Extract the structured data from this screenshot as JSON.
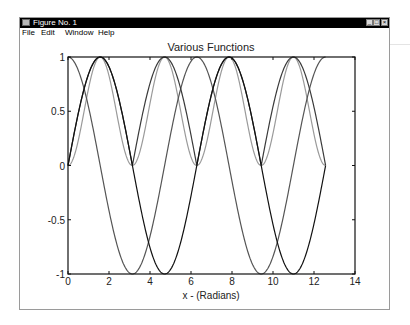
{
  "window": {
    "title": "Figure No. 1",
    "buttons": [
      "minimize",
      "maximize",
      "close"
    ],
    "button_glyphs": {
      "minimize": "_",
      "maximize": "□",
      "close": "×"
    }
  },
  "menubar": {
    "items": [
      {
        "label": "File"
      },
      {
        "label": "Edit"
      },
      {
        "label": "Window"
      },
      {
        "label": "Help"
      }
    ]
  },
  "chart_data": {
    "type": "line",
    "title": "Various Functions",
    "xlabel": "x - (Radians)",
    "ylabel": "",
    "xlim": [
      0,
      14
    ],
    "ylim": [
      -1,
      1
    ],
    "xticks": [
      0,
      2,
      4,
      6,
      8,
      10,
      12,
      14
    ],
    "yticks": [
      -1,
      -0.5,
      0,
      0.5,
      1
    ],
    "ytick_labels": [
      "-1",
      "-0.5",
      "0",
      "0.5",
      "1"
    ],
    "grid": false,
    "legend": null,
    "x_range_of_data": [
      0,
      12.566
    ],
    "series": [
      {
        "name": "sin(x)",
        "color": "#111111",
        "x": [
          0,
          0.785,
          1.571,
          2.356,
          3.142,
          3.927,
          4.712,
          5.498,
          6.283,
          7.069,
          7.854,
          8.639,
          9.425,
          10.21,
          10.996,
          11.781,
          12.566
        ],
        "values": [
          0,
          0.707,
          1,
          0.707,
          0,
          -0.707,
          -1,
          -0.707,
          0,
          0.707,
          1,
          0.707,
          0,
          -0.707,
          -1,
          -0.707,
          0
        ]
      },
      {
        "name": "cos(x)",
        "color": "#555555",
        "x": [
          0,
          0.785,
          1.571,
          2.356,
          3.142,
          3.927,
          4.712,
          5.498,
          6.283,
          7.069,
          7.854,
          8.639,
          9.425,
          10.21,
          10.996,
          11.781,
          12.566
        ],
        "values": [
          1,
          0.707,
          0,
          -0.707,
          -1,
          -0.707,
          0,
          0.707,
          1,
          0.707,
          0,
          -0.707,
          -1,
          -0.707,
          0,
          0.707,
          1
        ]
      },
      {
        "name": "|sin(x)|",
        "color": "#3a3a3a",
        "x": [
          0,
          0.785,
          1.571,
          2.356,
          3.142,
          3.927,
          4.712,
          5.498,
          6.283,
          7.069,
          7.854,
          8.639,
          9.425,
          10.21,
          10.996,
          11.781,
          12.566
        ],
        "values": [
          0,
          0.707,
          1,
          0.707,
          0,
          0.707,
          1,
          0.707,
          0,
          0.707,
          1,
          0.707,
          0,
          0.707,
          1,
          0.707,
          0
        ]
      },
      {
        "name": "sin^2(x)",
        "color": "#9a9a9a",
        "x": [
          0,
          0.785,
          1.571,
          2.356,
          3.142,
          3.927,
          4.712,
          5.498,
          6.283,
          7.069,
          7.854,
          8.639,
          9.425,
          10.21,
          10.996,
          11.781,
          12.566
        ],
        "values": [
          0,
          0.5,
          1,
          0.5,
          0,
          0.5,
          1,
          0.5,
          0,
          0.5,
          1,
          0.5,
          0,
          0.5,
          1,
          0.5,
          0
        ]
      }
    ]
  }
}
